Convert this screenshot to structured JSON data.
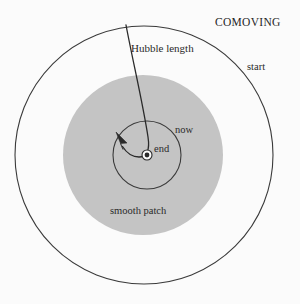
{
  "figure": {
    "title": "COMOVING",
    "background_color": "#fbfbfb",
    "line_color": "#3a3a3a",
    "shaded_region_color": "#c4c4c4",
    "labels": {
      "title": "COMOVING",
      "start": "start",
      "hubble_length": "Hubble length",
      "now": "now",
      "end": "end",
      "smooth_patch": "smooth patch"
    },
    "shapes": {
      "outer_circle": {
        "cx": 144,
        "cy": 155,
        "r": 129,
        "fill": "none",
        "stroke": "#3a3a3a",
        "label": "start"
      },
      "shaded_circle": {
        "cx": 143,
        "cy": 155,
        "r": 80,
        "fill": "#c4c4c4",
        "label": "smooth patch"
      },
      "inner_circle": {
        "cx": 147,
        "cy": 155,
        "r": 34,
        "fill": "none",
        "stroke": "#3a3a3a",
        "label": "now"
      },
      "center_ring": {
        "cx": 147,
        "cy": 155,
        "r": 5,
        "fill": "none",
        "stroke": "#3a3a3a"
      },
      "center_dot": {
        "cx": 147,
        "cy": 155,
        "r": 2.4,
        "fill": "#2a2a2a",
        "label": "end"
      }
    },
    "worldline": {
      "description": "Hubble length curve from outer circle to center with arrowhead",
      "start_point": [
        126,
        25
      ],
      "end_point": [
        122,
        135
      ],
      "arrow_direction": "upper-left"
    }
  }
}
